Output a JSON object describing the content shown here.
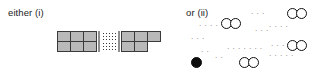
{
  "figure": {
    "caption_left": "either (i)",
    "caption_right": "or (ii)",
    "colors": {
      "cell_fill": "#b9b9b9",
      "cell_stroke": "#3a3a3a",
      "circle_stroke": "#111111",
      "circle_fill_open": "#ffffff",
      "circle_fill_closed": "#0d0d0d",
      "dots": "#5a5a5a",
      "background": "#ffffff"
    },
    "option_i": {
      "label": "either (i)",
      "description": "two-row strip of square cells with a dotted continuation band in the middle",
      "left_block": {
        "rows": 2,
        "columns": 3,
        "cells": [
          {
            "row": 0,
            "col": 0
          },
          {
            "row": 0,
            "col": 1
          },
          {
            "row": 0,
            "col": 2
          },
          {
            "row": 1,
            "col": 0
          },
          {
            "row": 1,
            "col": 1
          },
          {
            "row": 1,
            "col": 2
          }
        ]
      },
      "continuation": {
        "symbol": "dotted-band",
        "dot_columns": 5,
        "dot_rows": 5
      },
      "right_block": {
        "rows": 2,
        "top_row_columns": 3,
        "bottom_row_columns": 2,
        "cells": [
          {
            "row": 0,
            "col": 0
          },
          {
            "row": 0,
            "col": 1
          },
          {
            "row": 0,
            "col": 2
          },
          {
            "row": 1,
            "col": 0
          },
          {
            "row": 1,
            "col": 1
          }
        ]
      }
    },
    "option_ii": {
      "label": "or (ii)",
      "description": "scattered pairs of open circles with one filled circle at lower left, separated by ellipsis dots",
      "circle_pairs": [
        {
          "id": "pair-top-left",
          "x": 38,
          "y": 18,
          "fill": "open"
        },
        {
          "id": "pair-top-right",
          "x": 104,
          "y": 8,
          "fill": "open"
        },
        {
          "id": "pair-mid-right",
          "x": 104,
          "y": 40,
          "fill": "open"
        },
        {
          "id": "pair-bottom-mid",
          "x": 56,
          "y": 57,
          "fill": "open"
        }
      ],
      "single_circles": [
        {
          "id": "filled-circle-bottom-left",
          "x": 8,
          "y": 57,
          "fill": "closed"
        }
      ],
      "ellipses": [
        {
          "id": "dots-a",
          "x": 16,
          "y": 22,
          "text": "· · · ·"
        },
        {
          "id": "dots-b",
          "x": 68,
          "y": 10,
          "text": "· · ·"
        },
        {
          "id": "dots-c",
          "x": 72,
          "y": 27,
          "text": "· · ·"
        },
        {
          "id": "dots-d",
          "x": 86,
          "y": 23,
          "text": "· · · ·"
        },
        {
          "id": "dots-e",
          "x": 8,
          "y": 35,
          "text": "· · ·"
        },
        {
          "id": "dots-f",
          "x": 88,
          "y": 42,
          "text": "· · ·"
        },
        {
          "id": "dots-g",
          "x": 18,
          "y": 48,
          "text": "· ·"
        },
        {
          "id": "dots-h",
          "x": 44,
          "y": 45,
          "text": "· ·  · ·  · · ·"
        },
        {
          "id": "dots-i",
          "x": 86,
          "y": 52,
          "text": "· ·   · · ·"
        },
        {
          "id": "dots-j",
          "x": 32,
          "y": 54,
          "text": "· ·"
        }
      ]
    }
  }
}
